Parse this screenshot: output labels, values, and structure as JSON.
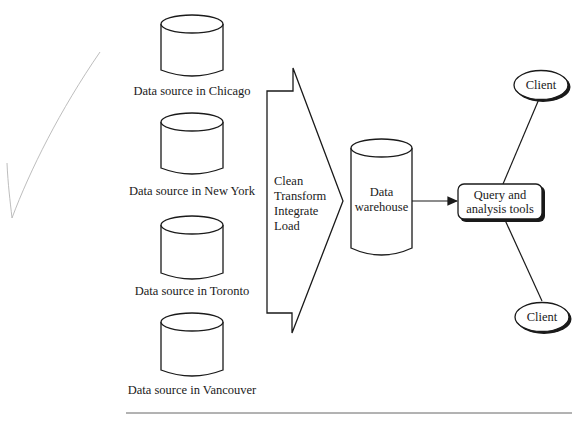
{
  "diagram": {
    "sources": [
      {
        "label": "Data source in Chicago"
      },
      {
        "label": "Data source in New York"
      },
      {
        "label": "Data source in Toronto"
      },
      {
        "label": "Data source in Vancouver"
      }
    ],
    "etl": {
      "steps": [
        "Clean",
        "Transform",
        "Integrate",
        "Load"
      ]
    },
    "warehouse": {
      "line1": "Data",
      "line2": "warehouse"
    },
    "tools": {
      "line1": "Query and",
      "line2": "analysis tools"
    },
    "clients": [
      {
        "label": "Client"
      },
      {
        "label": "Client"
      }
    ]
  },
  "annotation": {
    "mark": "checkmark",
    "color": "#b5b5b5"
  },
  "colors": {
    "stroke": "#1a1a1a",
    "background": "#ffffff"
  }
}
